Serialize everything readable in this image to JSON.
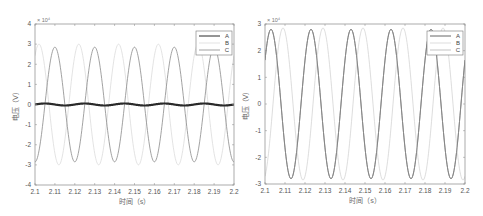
{
  "chart_data": [
    {
      "type": "line",
      "title": "",
      "xlabel": "时间（s）",
      "ylabel": "电压（V）",
      "y_exponent_label": "× 10⁴",
      "xlim": [
        2.1,
        2.2
      ],
      "ylim": [
        -4,
        4
      ],
      "y_scale": 10000,
      "x_ticks": [
        "2.1",
        "2.11",
        "2.12",
        "2.13",
        "2.14",
        "2.15",
        "2.16",
        "2.17",
        "2.18",
        "2.19",
        "2.2"
      ],
      "y_ticks": [
        "-4",
        "-3",
        "-2",
        "-1",
        "0",
        "1",
        "2",
        "3",
        "4"
      ],
      "grid": false,
      "legend_position": "upper right",
      "frequency_hz": 50,
      "series": [
        {
          "name": "A",
          "color": "#2a2a2a",
          "width": 2.2,
          "amplitude": 0.05,
          "phase_deg": 0,
          "description": "flat near 0"
        },
        {
          "name": "B",
          "color": "#dcdcdc",
          "width": 0.8,
          "amplitude": 3.0,
          "phase_deg": 54
        },
        {
          "name": "C",
          "color": "#8a8a8a",
          "width": 0.8,
          "amplitude": 2.85,
          "phase_deg": -90
        }
      ]
    },
    {
      "type": "line",
      "title": "",
      "xlabel": "时间（s）",
      "ylabel": "电压（V）",
      "y_exponent_label": "× 10⁴",
      "xlim": [
        2.1,
        2.2
      ],
      "ylim": [
        -3,
        3
      ],
      "y_scale": 10000,
      "x_ticks": [
        "2.1",
        "2.11",
        "2.12",
        "2.13",
        "2.14",
        "2.15",
        "2.16",
        "2.17",
        "2.18",
        "2.19",
        "2.2"
      ],
      "y_ticks": [
        "-3",
        "-2",
        "-1",
        "0",
        "1",
        "2",
        "3"
      ],
      "grid": false,
      "legend_position": "upper right",
      "frequency_hz": 50,
      "series": [
        {
          "name": "A",
          "color": "#555555",
          "width": 0.9,
          "amplitude": 2.8,
          "phase_deg": 36
        },
        {
          "name": "B",
          "color": "#d4d4d4",
          "width": 0.8,
          "amplitude": 2.85,
          "phase_deg": -72
        },
        {
          "name": "C",
          "color": "#9a9a9a",
          "width": 0.6,
          "amplitude": 2.8,
          "phase_deg": 36
        }
      ]
    }
  ]
}
